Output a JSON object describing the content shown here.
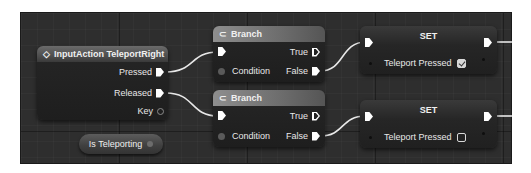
{
  "graph": {
    "input_action_node": {
      "title": "InputAction TeleportRight",
      "icon": "input-action-diamond-icon",
      "pins": [
        {
          "label": "Pressed",
          "type": "exec"
        },
        {
          "label": "Released",
          "type": "exec"
        },
        {
          "label": "Key",
          "type": "data"
        }
      ]
    },
    "variable_getter": {
      "label": "Is Teleporting"
    },
    "branch_nodes": [
      {
        "title": "Branch",
        "icon": "branch-icon",
        "inputs": [
          {
            "label": "",
            "type": "exec"
          },
          {
            "label": "Condition",
            "type": "bool"
          }
        ],
        "outputs": [
          {
            "label": "True",
            "type": "exec",
            "connected": false
          },
          {
            "label": "False",
            "type": "exec",
            "connected": true
          }
        ]
      },
      {
        "title": "Branch",
        "icon": "branch-icon",
        "inputs": [
          {
            "label": "",
            "type": "exec"
          },
          {
            "label": "Condition",
            "type": "bool"
          }
        ],
        "outputs": [
          {
            "label": "True",
            "type": "exec",
            "connected": false
          },
          {
            "label": "False",
            "type": "exec",
            "connected": true
          }
        ]
      }
    ],
    "set_nodes": [
      {
        "title": "SET",
        "variable": "Teleport Pressed",
        "checked": true
      },
      {
        "title": "SET",
        "variable": "Teleport Pressed",
        "checked": false
      }
    ]
  },
  "colors": {
    "canvas_bg": "#2e2e2e",
    "node_body": "#232323",
    "event_header": "#5a5a5a",
    "branch_header": "#7a7a7a",
    "wire": "#e8e8e8",
    "border": "#ffffff"
  }
}
